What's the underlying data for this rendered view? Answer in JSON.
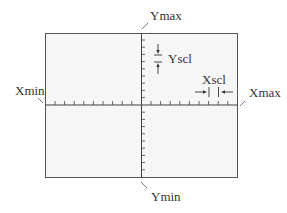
{
  "diagram": {
    "title": "",
    "labels": {
      "ymax": "Ymax",
      "ymin": "Ymin",
      "xmin": "Xmin",
      "xmax": "Xmax",
      "yscl": "Yscl",
      "xscl": "Xscl"
    },
    "window": {
      "x_ticks_left": 9,
      "x_ticks_right": 9,
      "y_ticks_top": 9,
      "y_ticks_bottom": 10
    },
    "colors": {
      "frame": "#555555",
      "fill": "#f6f6f6",
      "text": "#333333"
    }
  }
}
